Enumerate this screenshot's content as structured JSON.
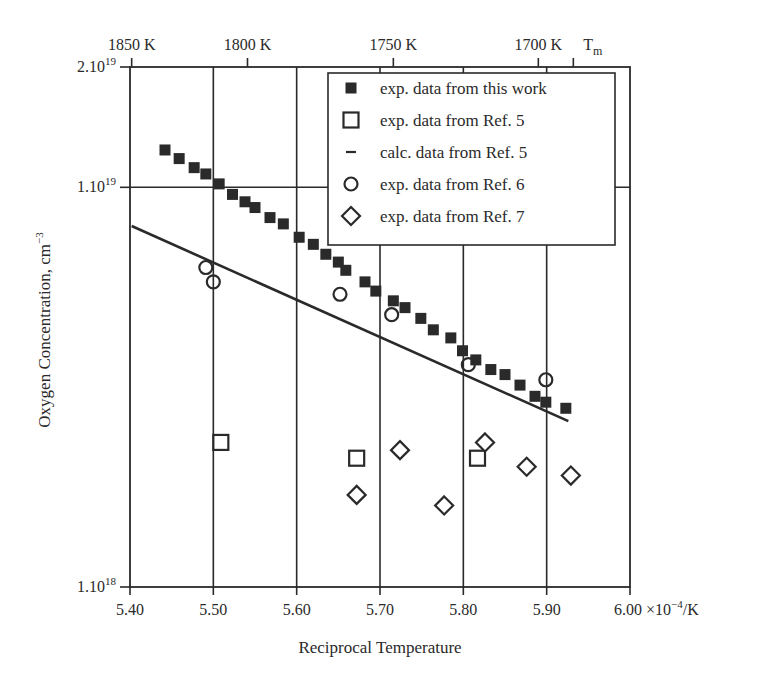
{
  "chart_data": {
    "type": "scatter",
    "title": "",
    "xlabel": "Reciprocal Temperature",
    "x_unit": "×10⁻⁴/K",
    "ylabel": "Oxygen Concentration, cm⁻³",
    "xlim": [
      5.4,
      6.0
    ],
    "ylim": [
      1e+18,
      2e+19
    ],
    "yscale": "log",
    "grid": true,
    "x_ticks": [
      5.4,
      5.5,
      5.6,
      5.7,
      5.8,
      5.9,
      6.0
    ],
    "x_tick_labels": [
      "5.40",
      "5.50",
      "5.60",
      "5.70",
      "5.80",
      "5.90",
      "6.00"
    ],
    "x_last_label_suffix": "×10",
    "x_last_label_exp": "−4",
    "x_last_label_unit": "/K",
    "y_ticks": [
      2e+19,
      1e+19,
      1e+18
    ],
    "y_tick_labels": [
      {
        "base": "2.10",
        "exp": "19"
      },
      {
        "base": "1.10",
        "exp": "19"
      },
      {
        "base": "1.10",
        "exp": "18"
      }
    ],
    "top_axis": {
      "label_ticks": [
        {
          "label": "1850 K",
          "x": 5.402
        },
        {
          "label": "1800 K",
          "x": 5.541
        },
        {
          "label": "1750 K",
          "x": 5.716
        },
        {
          "label": "1700 K",
          "x": 5.89
        }
      ],
      "tm": {
        "label": "T",
        "sub": "m",
        "x": 5.932
      }
    },
    "legend_position": "upper right (inside)",
    "series": [
      {
        "name": "exp. data from this work",
        "marker": "filled-square",
        "points": [
          [
            5.442,
            1.24e+19
          ],
          [
            5.459,
            1.18e+19
          ],
          [
            5.477,
            1.12e+19
          ],
          [
            5.491,
            1.08e+19
          ],
          [
            5.507,
            1.02e+19
          ],
          [
            5.523,
            9.6e+18
          ],
          [
            5.538,
            9.2e+18
          ],
          [
            5.55,
            8.9e+18
          ],
          [
            5.568,
            8.4e+18
          ],
          [
            5.584,
            8.1e+18
          ],
          [
            5.603,
            7.5e+18
          ],
          [
            5.62,
            7.2e+18
          ],
          [
            5.635,
            6.8e+18
          ],
          [
            5.65,
            6.5e+18
          ],
          [
            5.659,
            6.2e+18
          ],
          [
            5.682,
            5.8e+18
          ],
          [
            5.695,
            5.5e+18
          ],
          [
            5.716,
            5.2e+18
          ],
          [
            5.73,
            5e+18
          ],
          [
            5.749,
            4.7e+18
          ],
          [
            5.764,
            4.4e+18
          ],
          [
            5.785,
            4.2e+18
          ],
          [
            5.799,
            3.9e+18
          ],
          [
            5.815,
            3.7e+18
          ],
          [
            5.833,
            3.5e+18
          ],
          [
            5.85,
            3.4e+18
          ],
          [
            5.868,
            3.2e+18
          ],
          [
            5.886,
            3e+18
          ],
          [
            5.899,
            2.9e+18
          ],
          [
            5.923,
            2.8e+18
          ]
        ]
      },
      {
        "name": "exp. data from Ref. 5",
        "marker": "open-square",
        "points": [
          [
            5.509,
            2.3e+18
          ],
          [
            5.672,
            2.1e+18
          ],
          [
            5.817,
            2.1e+18
          ]
        ]
      },
      {
        "name": "calc. data from Ref. 5",
        "marker": "line",
        "points": [
          [
            5.402,
            8e+18
          ],
          [
            5.926,
            2.6e+18
          ]
        ]
      },
      {
        "name": "exp. data from Ref. 6",
        "marker": "open-circle",
        "points": [
          [
            5.491,
            6.3e+18
          ],
          [
            5.5,
            5.8e+18
          ],
          [
            5.652,
            5.4e+18
          ],
          [
            5.714,
            4.8e+18
          ],
          [
            5.806,
            3.6e+18
          ],
          [
            5.899,
            3.3e+18
          ]
        ]
      },
      {
        "name": "exp. data from Ref. 7",
        "marker": "open-diamond",
        "points": [
          [
            5.672,
            1.7e+18
          ],
          [
            5.724,
            2.2e+18
          ],
          [
            5.826,
            2.3e+18
          ],
          [
            5.777,
            1.6e+18
          ],
          [
            5.876,
            2e+18
          ],
          [
            5.929,
            1.9e+18
          ]
        ]
      }
    ]
  },
  "labels": {
    "xlabel": "Reciprocal Temperature",
    "ylabel_text": "Oxygen Concentration, cm",
    "ylabel_exp": "−3"
  },
  "legend": [
    {
      "label": "exp. data from this work",
      "marker": "filled-square"
    },
    {
      "label": "exp. data from Ref. 5",
      "marker": "open-square"
    },
    {
      "label": "calc. data from Ref. 5",
      "marker": "dash"
    },
    {
      "label": "exp. data from Ref. 6",
      "marker": "open-circle"
    },
    {
      "label": "exp. data from Ref. 7",
      "marker": "open-diamond"
    }
  ],
  "colors": {
    "ink": "#2a2a2a",
    "background": "#ffffff"
  }
}
